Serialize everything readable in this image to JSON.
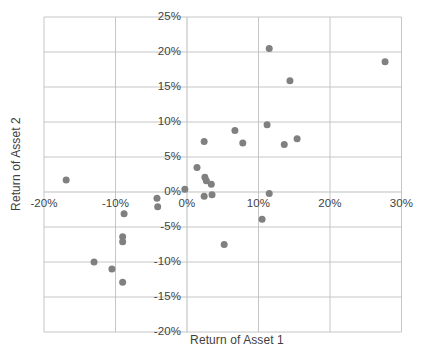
{
  "chart_data": {
    "type": "scatter",
    "title": "",
    "xlabel": "Return of Asset 1",
    "ylabel": "Return of Asset 2",
    "xlim": [
      -20,
      30
    ],
    "ylim": [
      -20,
      25
    ],
    "xticks": [
      "-20%",
      "-10%",
      "0%",
      "10%",
      "20%",
      "30%"
    ],
    "xtick_values": [
      -20,
      -10,
      0,
      10,
      20,
      30
    ],
    "yticks": [
      "25%",
      "20%",
      "15%",
      "10%",
      "5%",
      "0%",
      "-5%",
      "-10%",
      "-15%",
      "-20%"
    ],
    "ytick_values": [
      25,
      20,
      15,
      10,
      5,
      0,
      -5,
      -10,
      -15,
      -20
    ],
    "grid": true,
    "legend": false,
    "marker_color": "#808080",
    "marker_size": 7,
    "grid_color": "#bfbfbf",
    "series": [
      {
        "name": "Asset returns",
        "points": [
          [
            -16.9,
            1.7
          ],
          [
            -13.0,
            -10.0
          ],
          [
            -10.5,
            -11.0
          ],
          [
            -9.0,
            -12.9
          ],
          [
            -9.0,
            -6.4
          ],
          [
            -9.0,
            -7.1
          ],
          [
            -8.8,
            -3.1
          ],
          [
            -4.2,
            -0.9
          ],
          [
            -4.1,
            -2.1
          ],
          [
            -0.3,
            0.4
          ],
          [
            1.4,
            3.5
          ],
          [
            2.4,
            7.2
          ],
          [
            2.5,
            2.1
          ],
          [
            2.7,
            1.6
          ],
          [
            3.4,
            1.1
          ],
          [
            2.4,
            -0.6
          ],
          [
            3.5,
            -0.4
          ],
          [
            5.2,
            -7.5
          ],
          [
            6.7,
            8.8
          ],
          [
            7.8,
            7.0
          ],
          [
            11.2,
            9.6
          ],
          [
            11.5,
            20.5
          ],
          [
            11.5,
            -0.2
          ],
          [
            10.5,
            -3.9
          ],
          [
            13.6,
            6.8
          ],
          [
            14.4,
            15.9
          ],
          [
            15.4,
            7.6
          ],
          [
            27.7,
            18.6
          ]
        ]
      }
    ]
  }
}
